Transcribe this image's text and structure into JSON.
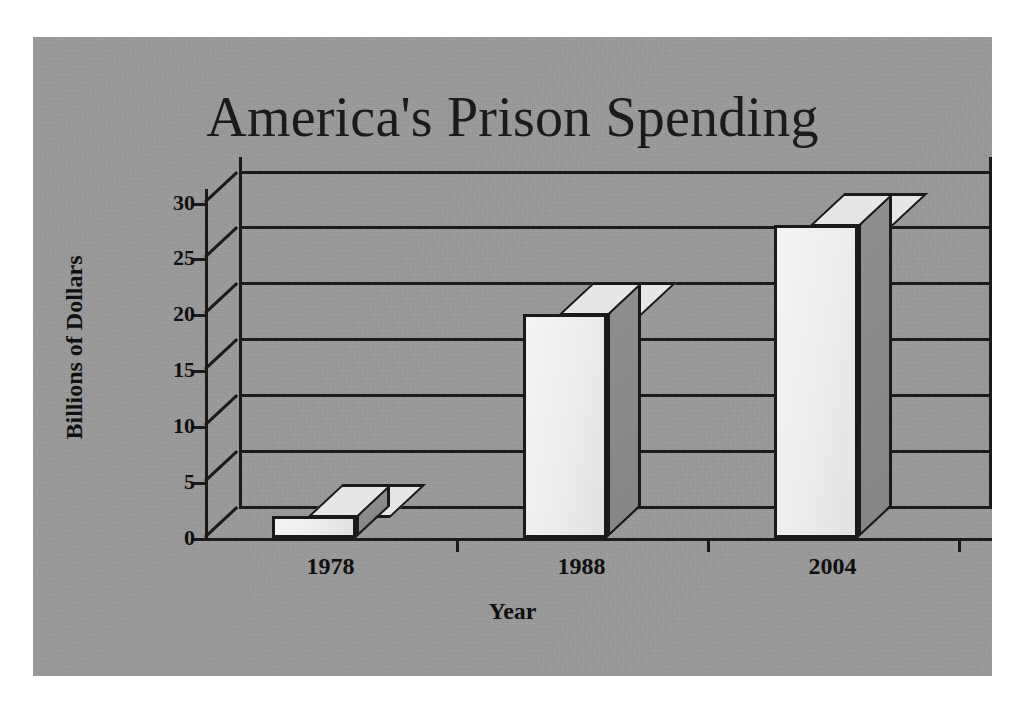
{
  "chart_data": {
    "type": "bar",
    "title": "America's Prison Spending",
    "xlabel": "Year",
    "ylabel": "Billions of Dollars",
    "categories": [
      "1978",
      "1988",
      "2004"
    ],
    "values": [
      2,
      20,
      28
    ],
    "ylim": [
      0,
      30
    ],
    "yticks": [
      0,
      5,
      10,
      15,
      20,
      25,
      30
    ],
    "ytick_labels": [
      "0",
      "5",
      "10",
      "15",
      "20",
      "25",
      "30"
    ],
    "grid": true,
    "legend": false,
    "style": "3d-column",
    "colors": {
      "panel_background": "#9a9a9a",
      "page_background": "#ffffff",
      "bar_front_face": "#ececec",
      "bar_side_face": "#8a8a8a",
      "bar_top_face": "#e6e6e6",
      "axis_and_gridlines": "#1a1a1a",
      "text": "#101010"
    }
  }
}
